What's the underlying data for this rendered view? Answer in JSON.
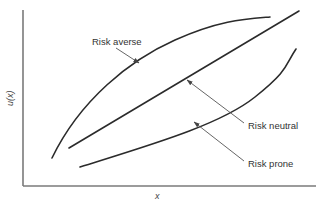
{
  "figure": {
    "type": "utility-function-diagram",
    "x_axis_label": "x",
    "y_axis_label": "u(x)"
  },
  "curves": [
    {
      "id": "risk-averse",
      "label": "Risk averse",
      "shape": "concave"
    },
    {
      "id": "risk-neutral",
      "label": "Risk neutral",
      "shape": "linear"
    },
    {
      "id": "risk-prone",
      "label": "Risk prone",
      "shape": "convex"
    }
  ],
  "colors": {
    "curve": "#2b2b2b",
    "axis": "#7a7a7a",
    "text": "#333333",
    "background": "#ffffff"
  }
}
